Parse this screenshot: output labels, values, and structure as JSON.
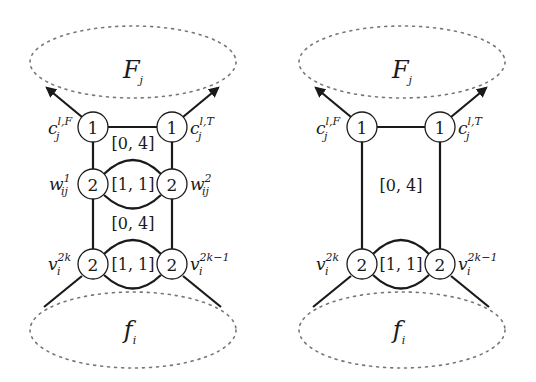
{
  "diagrams": [
    {
      "id": "left",
      "top_region_label": "F",
      "top_region_sub": "j",
      "bottom_region_label": "f",
      "bottom_region_sub": "i",
      "nodes": [
        {
          "name": "c-F",
          "value": "1",
          "label": "c",
          "sub": "j",
          "sup": "l,F"
        },
        {
          "name": "c-T",
          "value": "1",
          "label": "c",
          "sub": "j",
          "sup": "l,T"
        },
        {
          "name": "w1",
          "value": "2",
          "label": "w",
          "sub": "ij",
          "sup": "1"
        },
        {
          "name": "w2",
          "value": "2",
          "label": "w",
          "sub": "ij",
          "sup": "2"
        },
        {
          "name": "v2k",
          "value": "2",
          "label": "v",
          "sub": "i",
          "sup": "2k"
        },
        {
          "name": "v2k-1",
          "value": "2",
          "label": "v",
          "sub": "i",
          "sup": "2k−1"
        }
      ],
      "intervals": [
        "[0, 4]",
        "[1, 1]",
        "[0, 4]",
        "[1, 1]"
      ]
    },
    {
      "id": "right",
      "top_region_label": "F",
      "top_region_sub": "j",
      "bottom_region_label": "f",
      "bottom_region_sub": "i",
      "nodes": [
        {
          "name": "c-F",
          "value": "1",
          "label": "c",
          "sub": "j",
          "sup": "l,F"
        },
        {
          "name": "c-T",
          "value": "1",
          "label": "c",
          "sub": "j",
          "sup": "l,T"
        },
        {
          "name": "v2k",
          "value": "2",
          "label": "v",
          "sub": "i",
          "sup": "2k"
        },
        {
          "name": "v2k-1",
          "value": "2",
          "label": "v",
          "sub": "i",
          "sup": "2k−1"
        }
      ],
      "intervals": [
        "[0, 4]",
        "[1, 1]"
      ]
    }
  ]
}
